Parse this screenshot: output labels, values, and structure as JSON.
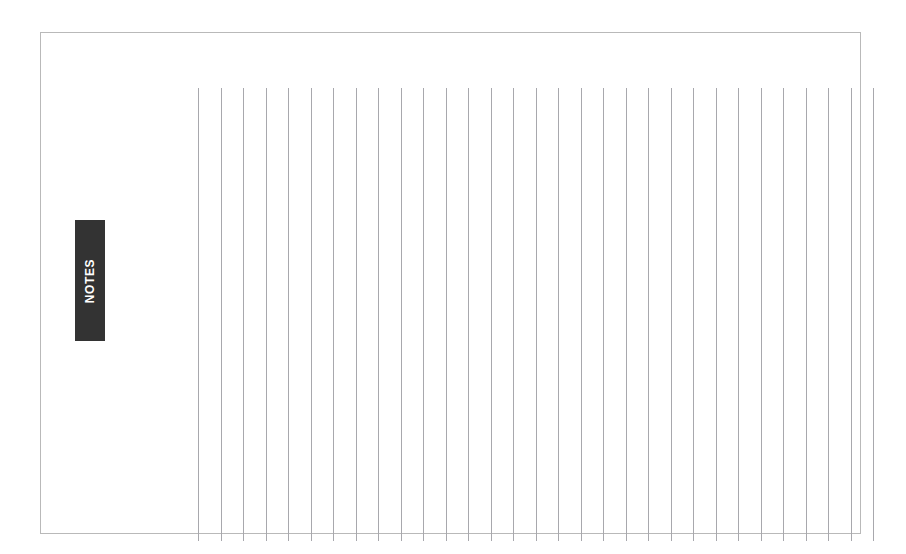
{
  "page": {
    "background_color": "#ffffff",
    "width": 906,
    "height": 554
  },
  "sheet": {
    "name": "notes-sheet",
    "border_color": "#b9b9b9",
    "fill_color": "#ffffff"
  },
  "notes_tab": {
    "label": "NOTES",
    "background_color": "#333333",
    "text_color": "#ffffff",
    "orientation": "vertical-bottom-to-top"
  },
  "ruled_area": {
    "name": "vertical-ruled-writing-area",
    "line_color": "#a8a8ad",
    "line_count": 31,
    "line_spacing_px": 22.5,
    "orientation": "vertical"
  }
}
